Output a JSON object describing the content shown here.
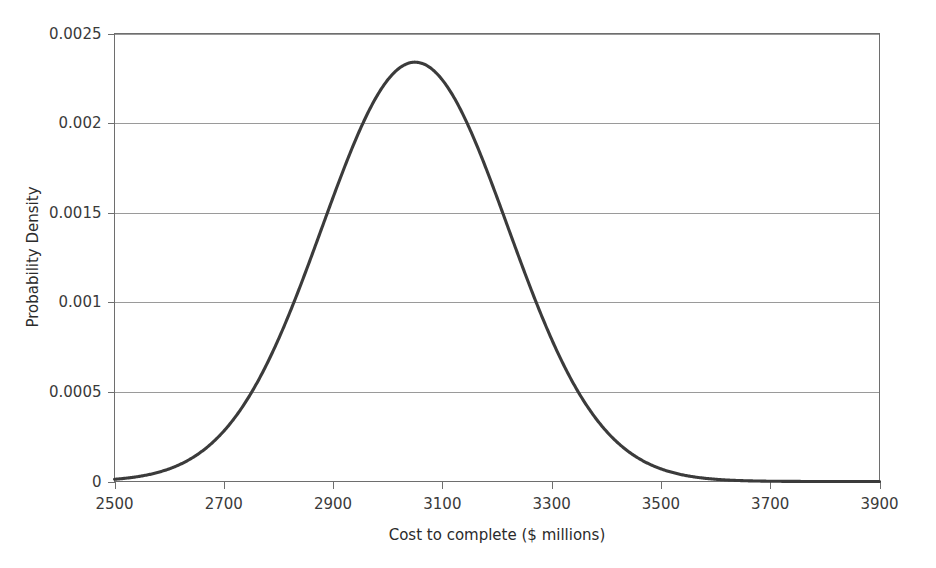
{
  "chart_data": {
    "type": "line",
    "title": "",
    "subtitle": "",
    "xlabel": "Cost to complete ($ millions)",
    "ylabel": "Probability Density",
    "xlim": [
      2500,
      3900
    ],
    "ylim": [
      0,
      0.0025
    ],
    "x_ticks": [
      2500,
      2700,
      2900,
      3100,
      3300,
      3500,
      3700,
      3900
    ],
    "x_tick_labels": [
      "2500",
      "2700",
      "2900",
      "3100",
      "3300",
      "3500",
      "3700",
      "3900"
    ],
    "y_ticks": [
      0,
      0.0005,
      0.001,
      0.0015,
      0.002,
      0.0025
    ],
    "y_tick_labels": [
      "0",
      "0.0005",
      "0.001",
      "0.0015",
      "0.002",
      "0.0025"
    ],
    "grid": {
      "horizontal": true,
      "vertical": false
    },
    "legend": {
      "visible": false,
      "position": "none"
    },
    "series": [
      {
        "name": "Probability density of cost to complete",
        "distribution": "normal",
        "mean": 3050,
        "std_dev": 170,
        "peak_value": 0.00234,
        "color": "#3b3b3b",
        "x": [
          2500,
          2550,
          2600,
          2650,
          2700,
          2750,
          2800,
          2850,
          2900,
          2950,
          3000,
          3050,
          3100,
          3150,
          3200,
          3250,
          3300,
          3350,
          3400,
          3450,
          3500,
          3550,
          3600,
          3650,
          3700,
          3750,
          3800,
          3850,
          3900
        ],
        "values": [
          1e-05,
          3e-05,
          8e-05,
          0.00019,
          0.00041,
          0.00079,
          0.00134,
          0.00193,
          0.00237,
          0.00248,
          0.00216,
          0.00157,
          0.00097,
          0.00051,
          0.00023,
          9e-05,
          3e-05,
          1e-05,
          2e-06,
          4e-07,
          5e-08,
          5e-09,
          4e-10,
          3e-11,
          1e-12,
          1e-13,
          1e-14,
          1e-15,
          1e-16
        ]
      }
    ]
  },
  "axes": {
    "x_title": "Cost to complete ($ millions)",
    "y_title": "Probability Density",
    "x_tick_labels": [
      "2500",
      "2700",
      "2900",
      "3100",
      "3300",
      "3500",
      "3700",
      "3900"
    ],
    "y_tick_labels": [
      "0",
      "0.0005",
      "0.001",
      "0.0015",
      "0.002",
      "0.0025"
    ]
  },
  "colors": {
    "curve": "#3b3b3b",
    "gridline": "#9a9a9a",
    "frame": "#6e6e6e",
    "background": "#ffffff",
    "text": "#2b2b2b"
  }
}
